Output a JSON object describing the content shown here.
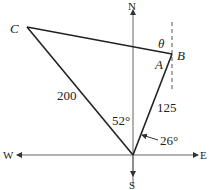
{
  "diagram": {
    "points": {
      "C": {
        "label": "C"
      },
      "B": {
        "label": "B"
      },
      "A": {
        "label": "A"
      },
      "theta": {
        "label": "θ"
      }
    },
    "compass": {
      "north": "N",
      "south": "S",
      "east": "E",
      "west": "W"
    },
    "measures": {
      "side_OC": "200",
      "side_OB": "125",
      "angle_between": "52°",
      "angle_bearing": "26°"
    },
    "colors": {
      "line": "#222222",
      "axis": "#555555"
    }
  }
}
